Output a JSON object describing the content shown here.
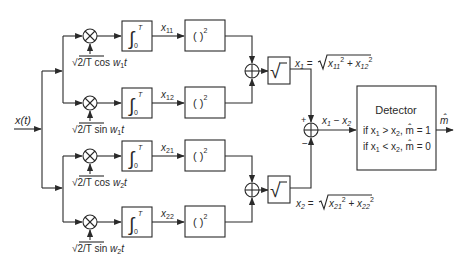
{
  "diagram": {
    "input_label": "x(t)",
    "output_label": "m̂",
    "branches": [
      {
        "id": "11",
        "ref_prefix": "√2/T",
        "ref_func": "cos",
        "ref_arg": "w",
        "ref_sub": "1",
        "ref_t": "t",
        "out_label": "x",
        "out_sub": "11"
      },
      {
        "id": "12",
        "ref_prefix": "√2/T",
        "ref_func": "sin",
        "ref_arg": "w",
        "ref_sub": "1",
        "ref_t": "t",
        "out_label": "x",
        "out_sub": "12"
      },
      {
        "id": "21",
        "ref_prefix": "√2/T",
        "ref_func": "cos",
        "ref_arg": "w",
        "ref_sub": "2",
        "ref_t": "t",
        "out_label": "x",
        "out_sub": "21"
      },
      {
        "id": "22",
        "ref_prefix": "√2/T",
        "ref_func": "sin",
        "ref_arg": "w",
        "ref_sub": "2",
        "ref_t": "t",
        "out_label": "x",
        "out_sub": "22"
      }
    ],
    "integrator": {
      "symbol": "∫",
      "upper": "T",
      "lower": "0"
    },
    "square_block": {
      "text": "(   )",
      "exp": "2"
    },
    "sqrt_block": {
      "symbol": "√"
    },
    "x1_expr": {
      "lhs": "x",
      "lhs_sub": "1",
      "eq": " = ",
      "a": "x",
      "a_sub": "11",
      "b": "x",
      "b_sub": "12",
      "exp": "2",
      "plus": " + "
    },
    "x2_expr": {
      "lhs": "x",
      "lhs_sub": "2",
      "eq": " = ",
      "a": "x",
      "a_sub": "21",
      "b": "x",
      "b_sub": "22",
      "exp": "2",
      "plus": " + "
    },
    "diff_label": {
      "a": "x",
      "a_sub": "1",
      "minus": " − ",
      "b": "x",
      "b_sub": "2"
    },
    "subtractor_signs": {
      "plus": "+",
      "minus": "−"
    },
    "detector": {
      "title": "Detector",
      "rule1": {
        "pre": "if x",
        "s1": "1",
        "op": " > x",
        "s2": "2",
        "post": ",  m̂ = 1"
      },
      "rule2": {
        "pre": "if x",
        "s1": "1",
        "op": " < x",
        "s2": "2",
        "post": ",  m̂ = 0"
      }
    }
  }
}
